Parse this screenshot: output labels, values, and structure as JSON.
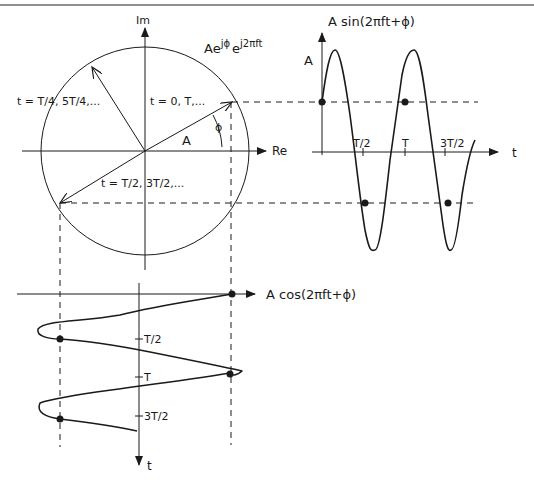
{
  "figure": {
    "title_rule_color": "#6b6b6b",
    "ink_color": "#1a1a1a"
  },
  "phasor": {
    "axis_im_label": "Im",
    "axis_re_label": "Re",
    "expression": "Aeʲᵠ eʲ²ᵖʰᵗ",
    "expression_base1": "Ae",
    "expression_sup1": "jϕ",
    "expression_base2": "e",
    "expression_sup2": "j2πft",
    "magnitude_label": "A",
    "phase_label": "ϕ",
    "vector_t0_label": "t = 0, T,...",
    "vector_tquarter_label": "t = T/4, 5T/4,...",
    "vector_thalf_label": "t = T/2, 3T/2,..."
  },
  "sine_plot": {
    "title": "A sin(2πft+ϕ)",
    "amplitude_label": "A",
    "t_axis_label": "t",
    "ticks": [
      "T/2",
      "T",
      "3T/2"
    ]
  },
  "cosine_plot": {
    "title": "A cos(2πft+ϕ)",
    "t_axis_label": "t",
    "ticks": [
      "T/2",
      "T",
      "3T/2"
    ]
  }
}
